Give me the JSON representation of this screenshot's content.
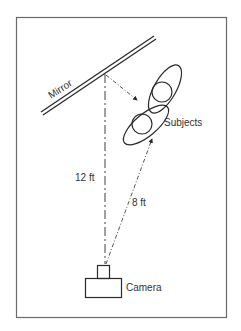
{
  "diagram": {
    "labels": {
      "mirror": "Mirror",
      "subjects": "Subjects",
      "camera": "Camera",
      "distance_camera_to_mirror": "12 ft",
      "distance_camera_to_subjects": "8 ft"
    },
    "colors": {
      "line": "#2a2a2a",
      "frame": "#6a6a6a",
      "text": "#333333",
      "background": "#ffffff"
    }
  }
}
